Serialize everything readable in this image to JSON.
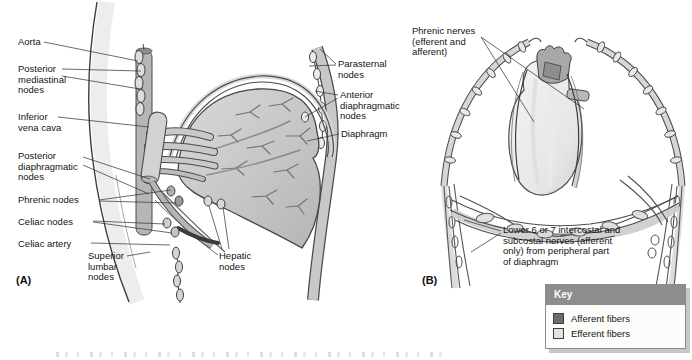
{
  "figure": {
    "type": "anatomical-diagram"
  },
  "panelA": {
    "letter": "(A)",
    "labels": {
      "aorta": "Aorta",
      "posteriorMediastinalNodes": "Posterior\nmediastinal\nnodes",
      "inferiorVenaCava": "Inferior\nvena cava",
      "posteriorDiaphragmaticNodes": "Posterior\ndiaphragmatic\nnodes",
      "phrenicNodes": "Phrenic nodes",
      "celiacNodes": "Celiac nodes",
      "celiacArtery": "Celiac artery",
      "superiorLumbarNodes": "Superior\nlumbar\nnodes",
      "hepaticNodes": "Hepatic\nnodes",
      "parasternalNodes": "Parasternal\nnodes",
      "anteriorDiaphragmaticNodes": "Anterior\ndiaphragmatic\nnodes",
      "diaphragm": "Diaphragm"
    }
  },
  "panelB": {
    "letter": "(B)",
    "labels": {
      "phrenicNerves": "Phrenic nerves\n(efferent and\nafferent)",
      "intercostalNerves": "Lower 6 or 7 intercostal and\nsubcostal nerves (afferent\nonly) from peripheral part\nof diaphragm"
    }
  },
  "key": {
    "title": "Key",
    "headerColor": "#8d8d8d",
    "entries": [
      {
        "label": "Afferent fibers",
        "swatch": "#6b6b6b"
      },
      {
        "label": "Efferent fibers",
        "swatch": "#e3e3e3"
      }
    ]
  }
}
